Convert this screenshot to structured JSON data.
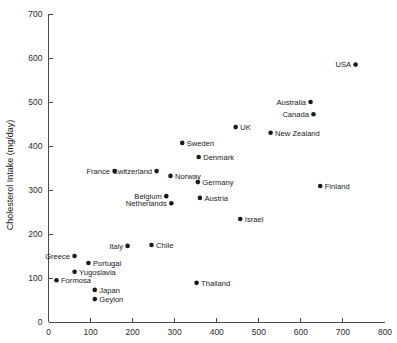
{
  "chart_data": {
    "type": "scatter",
    "title": "",
    "xlabel": "",
    "ylabel": "Cholesterol Intake (mg/day)",
    "xlim": [
      0,
      800
    ],
    "ylim": [
      0,
      700
    ],
    "xticks": [
      0,
      100,
      200,
      300,
      400,
      500,
      600,
      700,
      800
    ],
    "yticks": [
      0,
      100,
      200,
      300,
      400,
      500,
      600,
      700
    ],
    "xtick_labels": [
      "0",
      "100",
      "200",
      "300",
      "400",
      "500",
      "600",
      "700",
      "800"
    ],
    "ytick_labels": [
      "0",
      "100",
      "200",
      "300",
      "400",
      "500",
      "600",
      "700"
    ],
    "grid": false,
    "legend": "none",
    "points": [
      {
        "name": "USA",
        "x": 730,
        "y": 585,
        "label_side": "left"
      },
      {
        "name": "Australia",
        "x": 623,
        "y": 500,
        "label_side": "left"
      },
      {
        "name": "Canada",
        "x": 630,
        "y": 472,
        "label_side": "left"
      },
      {
        "name": "UK",
        "x": 445,
        "y": 443,
        "label_side": "right"
      },
      {
        "name": "New Zealand",
        "x": 528,
        "y": 430,
        "label_side": "right"
      },
      {
        "name": "Sweden",
        "x": 318,
        "y": 407,
        "label_side": "right"
      },
      {
        "name": "Denmark",
        "x": 357,
        "y": 375,
        "label_side": "right"
      },
      {
        "name": "France",
        "x": 157,
        "y": 343,
        "label_side": "left"
      },
      {
        "name": "Switzerland",
        "x": 257,
        "y": 343,
        "label_side": "left"
      },
      {
        "name": "Norway",
        "x": 290,
        "y": 332,
        "label_side": "right"
      },
      {
        "name": "Germany",
        "x": 355,
        "y": 318,
        "label_side": "right"
      },
      {
        "name": "Finland",
        "x": 646,
        "y": 309,
        "label_side": "right"
      },
      {
        "name": "Belgium",
        "x": 280,
        "y": 286,
        "label_side": "left"
      },
      {
        "name": "Austria",
        "x": 360,
        "y": 282,
        "label_side": "right"
      },
      {
        "name": "Netherlands",
        "x": 292,
        "y": 270,
        "label_side": "left"
      },
      {
        "name": "Israel",
        "x": 456,
        "y": 234,
        "label_side": "right"
      },
      {
        "name": "Italy",
        "x": 188,
        "y": 173,
        "label_side": "left"
      },
      {
        "name": "Chile",
        "x": 245,
        "y": 175,
        "label_side": "right"
      },
      {
        "name": "Greece",
        "x": 62,
        "y": 150,
        "label_side": "left"
      },
      {
        "name": "Portugal",
        "x": 95,
        "y": 134,
        "label_side": "right"
      },
      {
        "name": "Yugoslavia",
        "x": 62,
        "y": 114,
        "label_side": "right"
      },
      {
        "name": "Formosa",
        "x": 19,
        "y": 95,
        "label_side": "right"
      },
      {
        "name": "Japan",
        "x": 110,
        "y": 73,
        "label_side": "right"
      },
      {
        "name": "Geylon",
        "x": 110,
        "y": 52,
        "label_side": "right"
      },
      {
        "name": "Thailand",
        "x": 352,
        "y": 89,
        "label_side": "right"
      }
    ]
  }
}
